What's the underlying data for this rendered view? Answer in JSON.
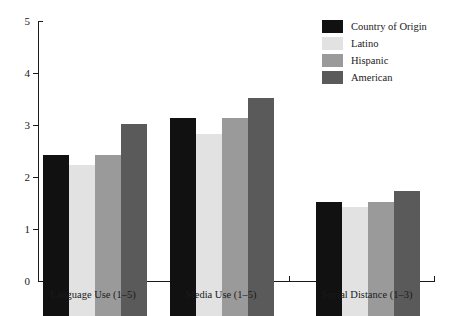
{
  "chart_data": {
    "type": "bar",
    "title": "",
    "subtitle": "",
    "xlabel": "",
    "ylabel": "",
    "ylim": [
      0,
      5
    ],
    "y_ticks": [
      0,
      1,
      2,
      3,
      4,
      5
    ],
    "y_tick_labels": [
      "0",
      "1",
      "2",
      "3",
      "4",
      "5"
    ],
    "grid": false,
    "legend_position": "top-right",
    "categories": [
      "Language Use (1–5)",
      "Media Use (1–5)",
      "Social Distance (1–3)"
    ],
    "series": [
      {
        "name": "Country of Origin",
        "color": "#111111",
        "values": [
          3.1,
          3.8,
          2.2
        ]
      },
      {
        "name": "Latino",
        "color": "#e2e2e2",
        "values": [
          2.9,
          3.5,
          2.1
        ]
      },
      {
        "name": "Hispanic",
        "color": "#9a9a9a",
        "values": [
          3.1,
          3.8,
          2.2
        ]
      },
      {
        "name": "American",
        "color": "#5a5a5a",
        "values": [
          3.7,
          4.2,
          2.4
        ]
      }
    ]
  },
  "legend": {
    "items": [
      {
        "label": "Country of Origin",
        "color": "#111111"
      },
      {
        "label": "Latino",
        "color": "#e2e2e2"
      },
      {
        "label": "Hispanic",
        "color": "#9a9a9a"
      },
      {
        "label": "American",
        "color": "#5a5a5a"
      }
    ]
  },
  "axes": {
    "y_tick_labels": [
      "5",
      "4",
      "3",
      "2",
      "1",
      "0"
    ]
  }
}
